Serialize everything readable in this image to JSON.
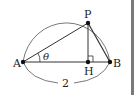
{
  "figure": {
    "labels": {
      "A": "A",
      "B": "B",
      "P": "P",
      "H": "H",
      "angle": "θ",
      "length": "2"
    },
    "points": {
      "A": [
        23,
        62
      ],
      "B": [
        110,
        62
      ],
      "P": [
        88,
        23
      ],
      "H": [
        88,
        62
      ]
    },
    "colors": {
      "line": "#333333",
      "arc": "#555555",
      "divider": "#7a7a7a"
    }
  }
}
